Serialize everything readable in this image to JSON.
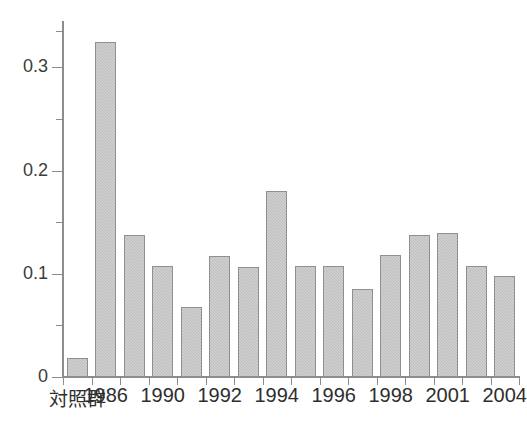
{
  "chart_data": {
    "type": "bar",
    "title": "",
    "subtitle": "",
    "xlabel": "",
    "ylabel": "",
    "xlim": [
      0,
      17
    ],
    "ylim": [
      0,
      0.345
    ],
    "grid": false,
    "legend": null,
    "y_axis": {
      "major_ticks": [
        0,
        0.1,
        0.2,
        0.3
      ],
      "major_tick_labels": [
        "0",
        "0.1",
        "0.2",
        "0.3"
      ],
      "minor_ticks": [
        0.05,
        0.15,
        0.25,
        0.335
      ]
    },
    "categories": [
      "対照群",
      "1986",
      "1988",
      "1990",
      "1991",
      "1992",
      "1993",
      "1994",
      "1995",
      "1996",
      "1997",
      "1998",
      "2000",
      "2001",
      "2002",
      "2004"
    ],
    "visible_tick_labels": [
      {
        "index": 0,
        "text": "対照群",
        "cjk": true
      },
      {
        "index": 1,
        "text": "1986",
        "cjk": false
      },
      {
        "index": 3,
        "text": "1990",
        "cjk": false
      },
      {
        "index": 5,
        "text": "1992",
        "cjk": false
      },
      {
        "index": 7,
        "text": "1994",
        "cjk": false
      },
      {
        "index": 9,
        "text": "1996",
        "cjk": false
      },
      {
        "index": 11,
        "text": "1998",
        "cjk": false
      },
      {
        "index": 13,
        "text": "2001",
        "cjk": false
      },
      {
        "index": 15,
        "text": "2004",
        "cjk": false
      }
    ],
    "values": [
      0.018,
      0.325,
      0.138,
      0.108,
      0.068,
      0.117,
      0.107,
      0.18,
      0.108,
      0.108,
      0.085,
      0.118,
      0.138,
      0.14,
      0.108,
      0.098
    ],
    "colors": {
      "bar_fill": "#bcbcbc",
      "bar_edge": "#8f8f8f",
      "axis": "#8c8c8c",
      "text": "#2e2e2e",
      "background": "#ffffff"
    }
  }
}
